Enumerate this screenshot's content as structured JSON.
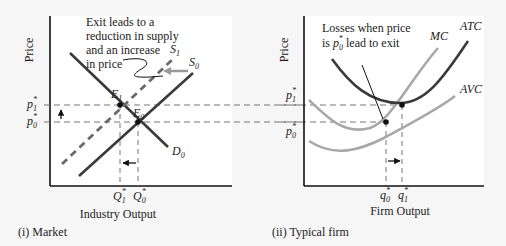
{
  "market": {
    "y_axis_label": "Price",
    "x_axis_label": "Industry Output",
    "caption": "(i) Market",
    "annotation": [
      "Exit leads to a",
      "reduction in supply",
      "and an increase",
      "in price"
    ],
    "curves": {
      "s1": "S",
      "s1_sub": "1",
      "s0": "S",
      "s0_sub": "0",
      "d0": "D",
      "d0_sub": "0"
    },
    "points": {
      "e1": "E",
      "e1_sub": "1",
      "e0": "E",
      "e0_sub": "0"
    },
    "price_ticks": {
      "p1": "p",
      "p1_sub": "1",
      "p0": "p",
      "p0_sub": "0",
      "star": "*"
    },
    "qty_ticks": {
      "q1": "Q",
      "q1_sub": "1",
      "q0": "Q",
      "q0_sub": "0",
      "star": "*"
    }
  },
  "firm": {
    "y_axis_label": "Price",
    "x_axis_label": "Firm Output",
    "caption": "(ii) Typical firm",
    "annotation_line1": "Losses when price",
    "annotation_line2_pre": "is ",
    "annotation_line2_p": "p",
    "annotation_line2_sub": "0",
    "annotation_line2_star": "*",
    "annotation_line2_post": " lead to exit",
    "curves": {
      "mc": "MC",
      "atc": "ATC",
      "avc": "AVC"
    },
    "price_ticks": {
      "p1": "p",
      "p1_sub": "1",
      "p0": "p",
      "p0_sub": "0",
      "star": "*"
    },
    "qty_ticks": {
      "q0": "q",
      "q0_sub": "0",
      "q1": "q",
      "q1_sub": "1",
      "star": "*"
    }
  },
  "colors": {
    "dark": "#3a3a3a",
    "light": "#a8a8a8",
    "panel": "#ffffff",
    "bg": "#f6f6f6"
  }
}
